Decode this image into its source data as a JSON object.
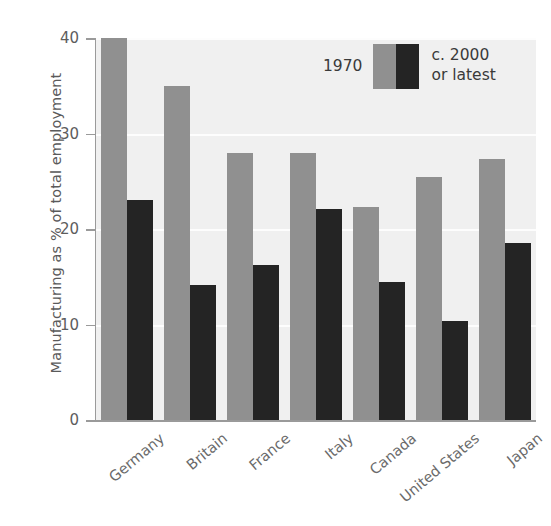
{
  "chart_data": {
    "type": "bar",
    "title": "",
    "subtitle": "",
    "xlabel": "",
    "ylabel": "Manufacturing as % of total employment",
    "categories": [
      "Germany",
      "Britain",
      "France",
      "Italy",
      "Canada",
      "United States",
      "Japan"
    ],
    "series": [
      {
        "name": "1970",
        "color": "#909090",
        "values": [
          40.0,
          35.0,
          28.0,
          28.0,
          22.3,
          25.4,
          27.3
        ]
      },
      {
        "name": "c. 2000 or latest",
        "color": "#242424",
        "values": [
          23.0,
          14.1,
          16.2,
          22.1,
          14.4,
          10.4,
          18.5
        ]
      }
    ],
    "ylim": [
      0,
      40
    ],
    "yticks": [
      0,
      10,
      20,
      30,
      40
    ],
    "ytick_labels": [
      "0",
      "10",
      "20",
      "30",
      "40"
    ],
    "grid": true,
    "grid_color": "#fdfdfd",
    "plot_background": "#f0f0f0",
    "legend_position": "top-right"
  },
  "legend": {
    "left_label": "1970",
    "right_label_line1": "c. 2000",
    "right_label_line2": "or latest"
  }
}
